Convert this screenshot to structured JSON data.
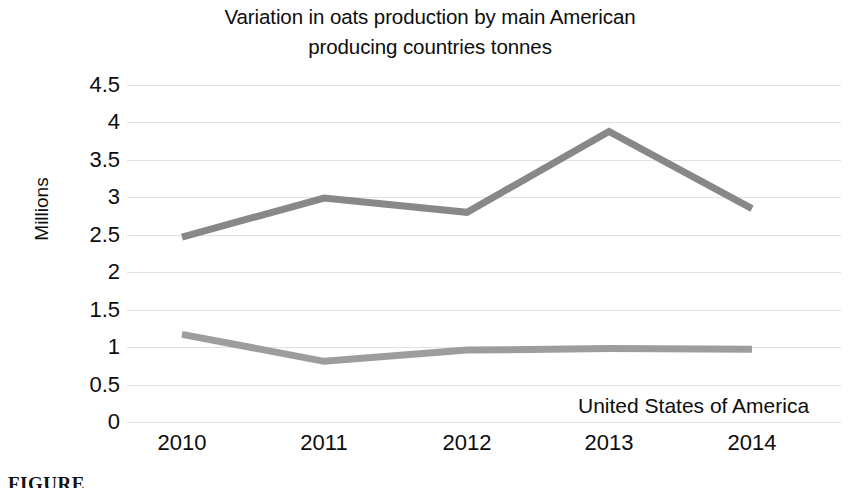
{
  "chart_data": {
    "type": "line",
    "title": "Variation in oats production by main American producing countries tonnes",
    "title_lines": [
      "Variation in oats production by main American",
      "producing countries tonnes"
    ],
    "xlabel": "",
    "ylabel": "Millions",
    "categories": [
      "2010",
      "2011",
      "2012",
      "2013",
      "2014"
    ],
    "ylim": [
      0,
      4.5
    ],
    "ytick_labels": [
      "0",
      "0.5",
      "1",
      "1.5",
      "2",
      "2.5",
      "3",
      "3.5",
      "4",
      "4.5"
    ],
    "ytick_values": [
      0,
      0.5,
      1,
      1.5,
      2,
      2.5,
      3,
      3.5,
      4,
      4.5
    ],
    "grid": true,
    "legend_position": "inline-annotation",
    "series": [
      {
        "name": "Canada",
        "values": [
          2.47,
          2.99,
          2.8,
          3.88,
          2.85
        ],
        "color": "#888888"
      },
      {
        "name": "United States of America",
        "values": [
          1.17,
          0.81,
          0.96,
          0.98,
          0.97
        ],
        "color": "#9d9d9d"
      }
    ],
    "annotations": [
      {
        "text": "Canada",
        "series": "Canada"
      },
      {
        "text": "United States of America",
        "series": "United States of America"
      }
    ]
  },
  "caption": {
    "text": "FIGURE"
  }
}
